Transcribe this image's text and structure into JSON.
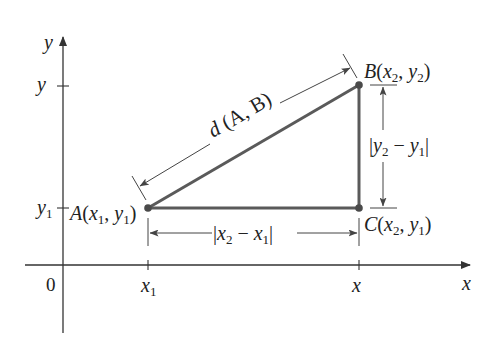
{
  "diagram": {
    "axes": {
      "x_label": "x",
      "y_label": "y",
      "origin_label": "0",
      "x_ticks": [
        {
          "label": "x",
          "sub": "1"
        },
        {
          "label": "x",
          "sub": ""
        }
      ],
      "y_ticks": [
        {
          "label": "y",
          "sub": ""
        },
        {
          "label": "y",
          "sub": "1"
        }
      ]
    },
    "points": {
      "A": {
        "name": "A",
        "coords": "(x₁, y₁)",
        "x_sym": "x",
        "x_sub": "1",
        "y_sym": "y",
        "y_sub": "1"
      },
      "B": {
        "name": "B",
        "coords": "(x₂, y₂)",
        "x_sym": "x",
        "x_sub": "2",
        "y_sym": "y",
        "y_sub": "2"
      },
      "C": {
        "name": "C",
        "coords": "(x₂, y₁)",
        "x_sym": "x",
        "x_sub": "2",
        "y_sym": "y",
        "y_sub": "1"
      }
    },
    "labels": {
      "hypotenuse": "d (A, B)",
      "horizontal": "|x₂ − x₁|",
      "vertical": "|y₂ − y₁|"
    },
    "colors": {
      "triangle": "#5a5a5a",
      "axes": "#333333",
      "text": "#222222",
      "background": "#ffffff"
    }
  }
}
